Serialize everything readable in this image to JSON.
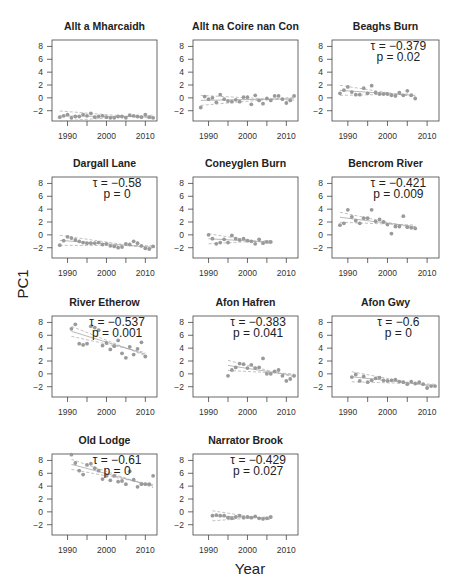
{
  "figure": {
    "ylabel": "PC1",
    "xlabel": "Year"
  },
  "chart_data": [
    {
      "type": "scatter",
      "title": "Allt a Mharcaidh",
      "xlim": [
        1986,
        2013
      ],
      "ylim": [
        -3.6,
        9
      ],
      "yticks": [
        -2,
        0,
        2,
        4,
        6,
        8
      ],
      "xticks": [
        1990,
        2000,
        2010
      ],
      "annotation": null,
      "x": [
        1988,
        1989,
        1990,
        1991,
        1992,
        1993,
        1994,
        1995,
        1996,
        1997,
        1998,
        1999,
        2000,
        2001,
        2002,
        2003,
        2004,
        2005,
        2006,
        2007,
        2008,
        2009,
        2010,
        2011,
        2012
      ],
      "y": [
        -3.0,
        -2.8,
        -2.6,
        -3.1,
        -2.9,
        -2.9,
        -2.6,
        -2.8,
        -2.4,
        -3.0,
        -2.9,
        -2.8,
        -3.0,
        -3.1,
        -3.1,
        -2.9,
        -2.9,
        -3.1,
        -2.7,
        -2.8,
        -2.9,
        -3.0,
        -2.6,
        -3.0,
        -3.1
      ]
    },
    {
      "type": "scatter",
      "title": "Allt na Coire nan Con",
      "xlim": [
        1986,
        2013
      ],
      "ylim": [
        -3.6,
        9
      ],
      "yticks": [
        -2,
        0,
        2,
        4,
        6,
        8
      ],
      "xticks": [
        1990,
        2000,
        2010
      ],
      "annotation": null,
      "x": [
        1988,
        1989,
        1990,
        1991,
        1992,
        1993,
        1994,
        1995,
        1996,
        1997,
        1998,
        1999,
        2000,
        2001,
        2002,
        2003,
        2004,
        2005,
        2006,
        2007,
        2008,
        2009,
        2010,
        2011,
        2012
      ],
      "y": [
        -1.5,
        0.2,
        -0.2,
        0.0,
        -0.7,
        0.5,
        -0.2,
        -0.5,
        -0.6,
        -0.3,
        -0.6,
        0.1,
        0.1,
        -1.0,
        0.4,
        -0.4,
        -0.9,
        -0.1,
        -0.4,
        0.3,
        0.3,
        -0.2,
        -0.8,
        -0.4,
        0.3
      ]
    },
    {
      "type": "scatter",
      "title": "Beaghs Burn",
      "xlim": [
        1986,
        2013
      ],
      "ylim": [
        -3.6,
        9
      ],
      "yticks": [
        -2,
        0,
        2,
        4,
        6,
        8
      ],
      "xticks": [
        1990,
        2000,
        2010
      ],
      "annotation": {
        "tau": "τ = −0.379",
        "p": "p =  0.02"
      },
      "x": [
        1988,
        1989,
        1990,
        1991,
        1992,
        1993,
        1994,
        1995,
        1996,
        1997,
        1998,
        1999,
        2000,
        2001,
        2002,
        2003,
        2004,
        2005,
        2006,
        2007
      ],
      "y": [
        0.7,
        1.2,
        1.7,
        0.9,
        0.5,
        0.5,
        1.5,
        0.7,
        1.9,
        0.8,
        0.6,
        0.6,
        0.6,
        0.4,
        0.3,
        0.8,
        0.4,
        1.1,
        0.4,
        -0.1
      ]
    },
    {
      "type": "scatter",
      "title": "Dargall Lane",
      "xlim": [
        1986,
        2013
      ],
      "ylim": [
        -3.6,
        9
      ],
      "yticks": [
        -2,
        0,
        2,
        4,
        6,
        8
      ],
      "xticks": [
        1990,
        2000,
        2010
      ],
      "annotation": {
        "tau": "τ = −0.58",
        "p": "p =  0"
      },
      "x": [
        1988,
        1989,
        1990,
        1991,
        1992,
        1993,
        1994,
        1995,
        1996,
        1997,
        1998,
        1999,
        2000,
        2001,
        2002,
        2003,
        2004,
        2005,
        2006,
        2007,
        2008,
        2009,
        2010,
        2011,
        2012
      ],
      "y": [
        -1.6,
        -0.9,
        -0.3,
        -0.5,
        -0.8,
        -1.0,
        -1.2,
        -1.3,
        -1.3,
        -1.3,
        -1.2,
        -1.5,
        -1.4,
        -1.7,
        -1.8,
        -2.0,
        -1.9,
        -1.4,
        -1.5,
        -1.0,
        -1.3,
        -1.7,
        -2.1,
        -2.2,
        -1.8
      ]
    },
    {
      "type": "scatter",
      "title": "Coneyglen Burn",
      "xlim": [
        1986,
        2013
      ],
      "ylim": [
        -3.6,
        9
      ],
      "yticks": [
        -2,
        0,
        2,
        4,
        6,
        8
      ],
      "xticks": [
        1990,
        2000,
        2010
      ],
      "annotation": null,
      "x": [
        1990,
        1991,
        1992,
        1993,
        1994,
        1995,
        1996,
        1997,
        1998,
        1999,
        2000,
        2001,
        2002,
        2003,
        2004,
        2005,
        2006
      ],
      "y": [
        0.0,
        -0.6,
        -1.4,
        -1.2,
        -0.7,
        -1.2,
        -0.1,
        -0.6,
        -0.8,
        -0.6,
        -0.9,
        -1.0,
        -1.4,
        -0.7,
        -1.3,
        -1.1,
        -1.1
      ]
    },
    {
      "type": "scatter",
      "title": "Bencrom River",
      "xlim": [
        1986,
        2013
      ],
      "ylim": [
        -3.6,
        9
      ],
      "yticks": [
        -2,
        0,
        2,
        4,
        6,
        8
      ],
      "xticks": [
        1990,
        2000,
        2010
      ],
      "annotation": {
        "tau": "τ = −0.421",
        "p": "p =  0.009"
      },
      "x": [
        1988,
        1989,
        1990,
        1991,
        1992,
        1993,
        1994,
        1995,
        1996,
        1997,
        1998,
        1999,
        2000,
        2001,
        2002,
        2003,
        2004,
        2005,
        2006,
        2007
      ],
      "y": [
        1.5,
        1.8,
        3.9,
        2.8,
        2.2,
        1.8,
        2.6,
        2.6,
        3.9,
        2.1,
        2.4,
        2.0,
        1.6,
        0.2,
        1.3,
        1.3,
        2.9,
        1.2,
        1.1,
        1.0
      ]
    },
    {
      "type": "scatter",
      "title": "River Etherow",
      "xlim": [
        1986,
        2013
      ],
      "ylim": [
        -3.6,
        9
      ],
      "yticks": [
        -2,
        0,
        2,
        4,
        6,
        8
      ],
      "xticks": [
        1990,
        2000,
        2010
      ],
      "annotation": {
        "tau": "τ = −0.537",
        "p": "p =  0.001"
      },
      "x": [
        1991,
        1992,
        1993,
        1994,
        1995,
        1996,
        1997,
        1998,
        1999,
        2000,
        2001,
        2002,
        2003,
        2004,
        2005,
        2006,
        2007,
        2008,
        2009,
        2010
      ],
      "y": [
        7.0,
        7.7,
        4.7,
        4.5,
        4.7,
        7.4,
        7.2,
        6.8,
        4.4,
        4.8,
        3.8,
        4.3,
        5.2,
        3.2,
        2.5,
        4.2,
        3.0,
        3.9,
        4.9,
        2.7
      ]
    },
    {
      "type": "scatter",
      "title": "Afon Hafren",
      "xlim": [
        1986,
        2013
      ],
      "ylim": [
        -3.6,
        9
      ],
      "yticks": [
        -2,
        0,
        2,
        4,
        6,
        8
      ],
      "xticks": [
        1990,
        2000,
        2010
      ],
      "annotation": {
        "tau": "τ = −0.383",
        "p": "p =  0.041"
      },
      "x": [
        1995,
        1996,
        1997,
        1998,
        1999,
        2000,
        2001,
        2002,
        2003,
        2004,
        2005,
        2006,
        2007,
        2008,
        2009,
        2010,
        2011,
        2012
      ],
      "y": [
        -0.3,
        0.6,
        1.0,
        1.6,
        1.5,
        0.9,
        1.4,
        0.9,
        1.0,
        2.4,
        0.0,
        0.0,
        0.4,
        0.6,
        -0.3,
        -1.1,
        -0.8,
        -0.3
      ]
    },
    {
      "type": "scatter",
      "title": "Afon Gwy",
      "xlim": [
        1986,
        2013
      ],
      "ylim": [
        -3.6,
        9
      ],
      "yticks": [
        -2,
        0,
        2,
        4,
        6,
        8
      ],
      "xticks": [
        1990,
        2000,
        2010
      ],
      "annotation": {
        "tau": "τ = −0.6",
        "p": "p =  0"
      },
      "x": [
        1991,
        1992,
        1993,
        1994,
        1995,
        1996,
        1997,
        1998,
        1999,
        2000,
        2001,
        2002,
        2003,
        2004,
        2005,
        2006,
        2007,
        2008,
        2009,
        2010,
        2011,
        2012
      ],
      "y": [
        -0.5,
        -0.1,
        -1.1,
        -0.4,
        -1.3,
        -1.0,
        -0.7,
        -0.6,
        -1.0,
        -1.1,
        -1.0,
        -0.9,
        -1.2,
        -1.3,
        -1.6,
        -1.2,
        -1.5,
        -1.3,
        -1.6,
        -2.2,
        -1.9,
        -1.9
      ]
    },
    {
      "type": "scatter",
      "title": "Old Lodge",
      "xlim": [
        1986,
        2013
      ],
      "ylim": [
        -3.6,
        9
      ],
      "yticks": [
        -2,
        0,
        2,
        4,
        6,
        8
      ],
      "xticks": [
        1990,
        2000,
        2010
      ],
      "annotation": {
        "tau": "τ = −0.61",
        "p": "p =  0"
      },
      "x": [
        1991,
        1992,
        1993,
        1994,
        1995,
        1996,
        1997,
        1998,
        1999,
        2000,
        2001,
        2002,
        2003,
        2004,
        2005,
        2006,
        2007,
        2008,
        2009,
        2010,
        2011,
        2012
      ],
      "y": [
        8.9,
        7.6,
        6.4,
        5.8,
        7.3,
        7.5,
        6.8,
        6.4,
        5.1,
        5.6,
        4.9,
        5.6,
        4.7,
        4.8,
        4.3,
        6.3,
        5.0,
        3.9,
        4.3,
        4.3,
        4.3,
        5.6
      ]
    },
    {
      "type": "scatter",
      "title": "Narrator Brook",
      "xlim": [
        1986,
        2013
      ],
      "ylim": [
        -3.6,
        9
      ],
      "yticks": [
        -2,
        0,
        2,
        4,
        6,
        8
      ],
      "xticks": [
        1990,
        2000,
        2010
      ],
      "annotation": {
        "tau": "τ = −0.429",
        "p": "p =  0.027"
      },
      "x": [
        1991,
        1992,
        1993,
        1994,
        1995,
        1996,
        1997,
        1998,
        1999,
        2000,
        2001,
        2002,
        2003,
        2004,
        2005,
        2006
      ],
      "y": [
        -0.6,
        -0.5,
        -0.6,
        -0.6,
        -0.9,
        -1.0,
        -0.8,
        -0.6,
        -0.9,
        -0.8,
        -0.9,
        -0.7,
        -1.0,
        -1.1,
        -1.0,
        -0.8
      ]
    }
  ],
  "style": {
    "point_color": "#9a9a9a",
    "line_color": "#a6a6a6",
    "axis_color": "#444444",
    "text_color": "#222222"
  }
}
